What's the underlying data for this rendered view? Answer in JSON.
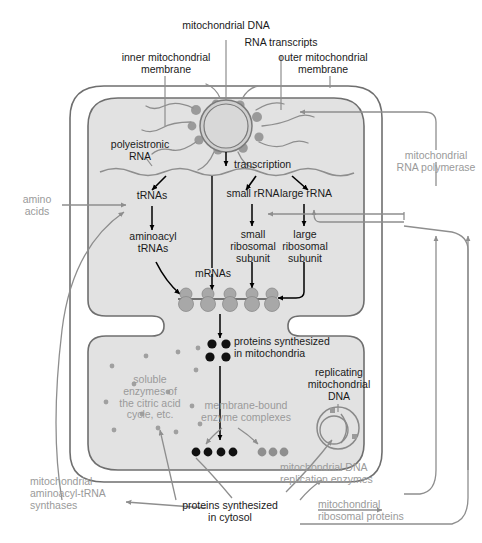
{
  "diagram": {
    "colors": {
      "outline": "#6f6f6f",
      "matrix_fill": "#e2e2e2",
      "intermembrane_fill": "#ffffff",
      "black_text": "#1a1a1a",
      "gray_text": "#9a9a9a",
      "gray_arrow": "#8e8e8e",
      "black_arrow": "#000000",
      "ribosome": "#a8a8a8",
      "protein_black": "#111111",
      "protein_gray": "#8f8f8f",
      "background": "#ffffff"
    }
  },
  "top_labels": [
    {
      "id": "inner-mitochondrial-membrane",
      "text": "inner mitochondrial\nmembrane"
    },
    {
      "id": "mitochondrial-dna",
      "text": "mitochondrial DNA"
    },
    {
      "id": "rna-transcripts",
      "text": "RNA transcripts"
    },
    {
      "id": "outer-mitochondrial-membrane",
      "text": "outer mitochondrial\nmembrane"
    }
  ],
  "matrix_labels": [
    {
      "id": "polyeistronic-rna",
      "text": "polyeistronic\nRNA"
    },
    {
      "id": "transcription",
      "text": "transcription"
    },
    {
      "id": "trnas",
      "text": "tRNAs"
    },
    {
      "id": "small-rrna",
      "text": "small rRNA"
    },
    {
      "id": "large-rrna",
      "text": "large rRNA"
    },
    {
      "id": "aminoacyl-trnas",
      "text": "aminoacyl\ntRNAs"
    },
    {
      "id": "small-ribosomal-subunit",
      "text": "small\nribosomal\nsubunit"
    },
    {
      "id": "large-ribosomal-subunit",
      "text": "large\nribosomal\nsubunit"
    },
    {
      "id": "mrnas",
      "text": "mRNAs"
    },
    {
      "id": "proteins-synthesized-in-mitochondria",
      "text": "proteins synthesized\nin mitochondria"
    },
    {
      "id": "replicating-mitochondrial-dna",
      "text": "replicating\nmitochondrial\nDNA"
    }
  ],
  "gray_labels": [
    {
      "id": "amino-acids",
      "text": "amino\nacids"
    },
    {
      "id": "mitochondrial-rna-polymerase",
      "text": "mitochondrial\nRNA polymerase"
    },
    {
      "id": "soluble-enzymes",
      "text": "soluble\nenzymes of\nthe citric acid\ncycle, etc."
    },
    {
      "id": "membrane-bound-enzyme-complexes",
      "text": "membrane-bound\nenzyme complexes"
    },
    {
      "id": "mitochondrial-dna-replication-enzymes",
      "text": "mitochondrial DNA\nreplication enzymes"
    },
    {
      "id": "mitochondrial-aminoacyl-trna-synthases",
      "text": "mitochondrial\naminoacyl-tRNA\nsynthases"
    },
    {
      "id": "mitochondrial-ribosomal-proteins",
      "text": "mitochondrial\nribosomal proteins"
    }
  ],
  "bottom_labels": [
    {
      "id": "proteins-synthesized-in-cytosol",
      "text": "proteins synthesized\nin cytosol"
    }
  ],
  "counts": {
    "ribosomes_on_mrna": 5,
    "proteins_in_mitochondria_dots": 4,
    "membrane_black_dots": 4,
    "membrane_gray_dots": 3
  }
}
